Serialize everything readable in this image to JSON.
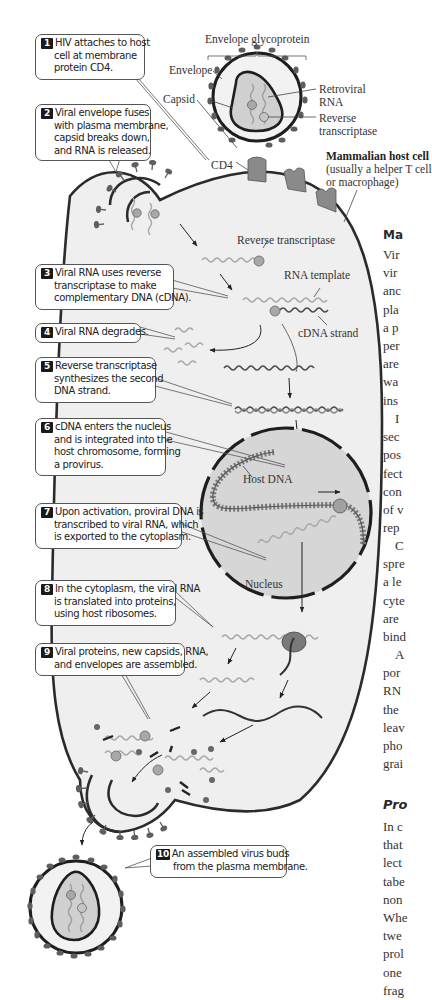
{
  "figure": {
    "labels": {
      "envelope_glycoprotein": "Envelope glycoprotein",
      "envelope": "Envelope",
      "capsid": "Capsid",
      "retroviral_rna": [
        "Retroviral",
        "RNA"
      ],
      "reverse_transcriptase_virion": [
        "Reverse",
        "transcriptase"
      ],
      "cd4": "CD4",
      "host_cell_title": "Mammalian host cell",
      "host_cell_subtitle": [
        "(usually a helper T cell",
        "or macrophage)"
      ],
      "reverse_transcriptase": "Reverse transcriptase",
      "rna_template": "RNA template",
      "cdna_strand": "cDNA strand",
      "host_dna": "Host DNA",
      "nucleus": "Nucleus"
    },
    "steps": [
      {
        "num": "1",
        "lines": [
          "HIV attaches to host",
          "cell at membrane",
          "protein CD4."
        ]
      },
      {
        "num": "2",
        "lines": [
          "Viral envelope fuses",
          "with plasma membrane,",
          "capsid breaks down,",
          "and RNA is released."
        ]
      },
      {
        "num": "3",
        "lines": [
          "Viral RNA uses reverse",
          "transcriptase to make",
          "complementary DNA (cDNA)."
        ]
      },
      {
        "num": "4",
        "lines": [
          "Viral RNA degrades."
        ]
      },
      {
        "num": "5",
        "lines": [
          "Reverse transcriptase",
          "synthesizes the second",
          "DNA strand."
        ]
      },
      {
        "num": "6",
        "lines": [
          "cDNA enters the nucleus",
          "and is integrated into the",
          "host chromosome, forming",
          "a provirus."
        ]
      },
      {
        "num": "7",
        "lines": [
          "Upon activation, proviral DNA is",
          "transcribed to viral RNA, which",
          "is exported to the cytoplasm."
        ]
      },
      {
        "num": "8",
        "lines": [
          "In the cytoplasm, the viral RNA",
          "is translated into proteins,",
          "using host ribosomes."
        ]
      },
      {
        "num": "9",
        "lines": [
          "Viral proteins, new capsids, RNA,",
          "and envelopes are assembled."
        ]
      },
      {
        "num": "10",
        "lines": [
          "An assembled virus buds",
          "from the plasma membrane."
        ]
      }
    ],
    "colors": {
      "cell_fill": "#efefef",
      "nucleus_fill": "#d6d6d6",
      "membrane": "#2b2b2b",
      "rna": "#a9a9a9",
      "dna_dark": "#4a4a4a",
      "protein": "#7c7c7c",
      "glycoprotein": "#5e5e5e"
    }
  },
  "right_column": {
    "heading_1": "Ma",
    "paragraph_1": [
      "Vir",
      "vir",
      "anc",
      "pla",
      "a p",
      "per",
      "are",
      "wa",
      "ins"
    ],
    "paragraph_2": [
      "I",
      "sec",
      "pos",
      "fect",
      "con",
      "of v",
      "rep"
    ],
    "paragraph_3": [
      "C",
      "spre",
      "a le",
      "cyte",
      "are",
      "bind"
    ],
    "paragraph_4": [
      "A",
      "por",
      "RN",
      "the",
      "leav",
      "pho",
      "grai"
    ],
    "heading_2": "Pro",
    "paragraph_5": [
      "In c",
      "that",
      "lect",
      "tabe",
      "non",
      "Whe",
      "twe",
      "prol",
      "one",
      "frag"
    ]
  }
}
